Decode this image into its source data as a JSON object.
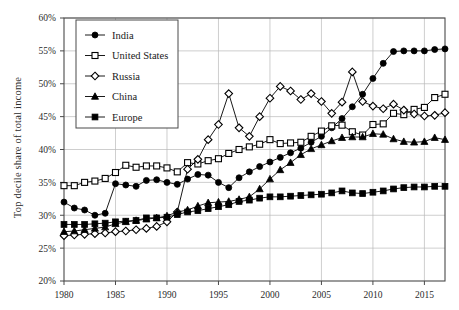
{
  "chart_data": {
    "type": "line",
    "title": "",
    "xlabel": "",
    "ylabel": "Top decile share of total income",
    "xlim": [
      1980,
      2017
    ],
    "ylim": [
      20,
      60
    ],
    "yticks": [
      20,
      25,
      30,
      35,
      40,
      45,
      50,
      55,
      60
    ],
    "ytick_labels": [
      "20%",
      "25%",
      "30%",
      "35%",
      "40%",
      "45%",
      "50%",
      "55%",
      "60%"
    ],
    "xticks": [
      1980,
      1985,
      1990,
      1995,
      2000,
      2005,
      2010,
      2015
    ],
    "xtick_labels": [
      "1980",
      "1985",
      "1990",
      "1995",
      "2000",
      "2005",
      "2010",
      "2015"
    ],
    "grid": true,
    "legend_position": "upper-left",
    "x": [
      1980,
      1981,
      1982,
      1983,
      1984,
      1985,
      1986,
      1987,
      1988,
      1989,
      1990,
      1991,
      1992,
      1993,
      1994,
      1995,
      1996,
      1997,
      1998,
      1999,
      2000,
      2001,
      2002,
      2003,
      2004,
      2005,
      2006,
      2007,
      2008,
      2009,
      2010,
      2011,
      2012,
      2013,
      2014,
      2015,
      2016,
      2017
    ],
    "series": [
      {
        "name": "India",
        "marker": "filled-circle",
        "color": "#000000",
        "values": [
          32.0,
          31.1,
          30.8,
          30.0,
          30.3,
          34.8,
          34.6,
          34.4,
          35.3,
          35.4,
          35.0,
          34.7,
          35.5,
          36.2,
          36.1,
          35.0,
          34.2,
          35.7,
          36.6,
          37.4,
          38.1,
          38.8,
          39.5,
          40.2,
          41.1,
          42.0,
          43.3,
          44.7,
          46.5,
          48.4,
          50.8,
          53.1,
          54.9,
          55.0,
          55.0,
          55.0,
          55.2,
          55.3
        ]
      },
      {
        "name": "United States",
        "marker": "open-square",
        "color": "#000000",
        "values": [
          34.5,
          34.5,
          35.0,
          35.2,
          35.6,
          36.5,
          37.6,
          37.3,
          37.5,
          37.5,
          37.2,
          36.6,
          38.0,
          37.8,
          38.3,
          38.6,
          39.4,
          40.0,
          40.4,
          40.8,
          41.5,
          40.9,
          41.0,
          41.1,
          42.0,
          42.8,
          43.6,
          43.7,
          42.7,
          42.2,
          43.8,
          43.9,
          45.5,
          45.3,
          46.1,
          46.4,
          47.9,
          48.4
        ]
      },
      {
        "name": "Russia",
        "marker": "open-diamond",
        "color": "#000000",
        "values": [
          26.9,
          27.0,
          27.1,
          27.2,
          27.3,
          27.5,
          27.6,
          27.8,
          28.0,
          28.3,
          29.0,
          30.5,
          37.0,
          38.5,
          41.5,
          43.8,
          48.5,
          43.3,
          42.0,
          45.0,
          47.8,
          49.6,
          48.9,
          47.6,
          48.5,
          47.3,
          45.5,
          47.2,
          51.8,
          47.3,
          46.6,
          46.2,
          46.9,
          46.0,
          45.4,
          45.1,
          45.2,
          45.6
        ]
      },
      {
        "name": "China",
        "marker": "filled-triangle",
        "color": "#000000",
        "values": [
          27.5,
          27.6,
          27.8,
          28.0,
          28.2,
          28.7,
          29.0,
          29.2,
          29.4,
          29.6,
          29.9,
          30.5,
          30.8,
          31.4,
          31.9,
          32.0,
          32.1,
          32.4,
          32.8,
          34.0,
          35.5,
          36.9,
          38.0,
          39.2,
          40.1,
          40.7,
          41.3,
          41.8,
          41.9,
          41.9,
          42.4,
          42.3,
          41.6,
          41.2,
          41.1,
          41.2,
          41.8,
          41.5
        ]
      },
      {
        "name": "Europe",
        "marker": "filled-square",
        "color": "#000000",
        "values": [
          28.6,
          28.6,
          28.6,
          28.7,
          28.8,
          29.0,
          29.1,
          29.2,
          29.6,
          29.6,
          29.7,
          30.1,
          30.5,
          30.7,
          31.0,
          31.3,
          31.6,
          32.1,
          32.3,
          32.6,
          32.8,
          32.8,
          32.9,
          33.0,
          33.1,
          33.2,
          33.4,
          33.7,
          33.4,
          33.3,
          33.5,
          33.7,
          34.0,
          34.2,
          34.3,
          34.3,
          34.4,
          34.4
        ]
      }
    ]
  },
  "legend": {
    "entries": [
      {
        "label": "India"
      },
      {
        "label": "United States"
      },
      {
        "label": "Russia"
      },
      {
        "label": "China"
      },
      {
        "label": "Europe"
      }
    ]
  }
}
